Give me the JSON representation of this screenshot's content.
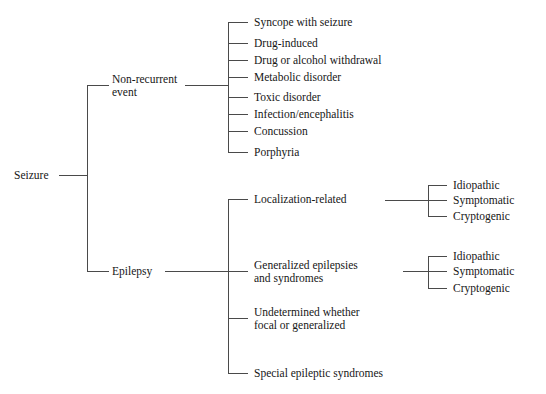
{
  "diagram": {
    "root": {
      "label": "Seizure"
    },
    "branches": [
      {
        "label_line1": "Non-recurrent",
        "label_line2": "event",
        "children": [
          {
            "label": "Syncope with seizure"
          },
          {
            "label": "Drug-induced"
          },
          {
            "label": "Drug or alcohol withdrawal"
          },
          {
            "label": "Metabolic disorder"
          },
          {
            "label": "Toxic disorder"
          },
          {
            "label": "Infection/encephalitis"
          },
          {
            "label": "Concussion"
          },
          {
            "label": "Porphyria"
          }
        ]
      },
      {
        "label_line1": "Epilepsy",
        "label_line2": "",
        "children": [
          {
            "label": "Localization-related",
            "subtypes": [
              {
                "label": "Idiopathic"
              },
              {
                "label": "Symptomatic"
              },
              {
                "label": "Cryptogenic"
              }
            ]
          },
          {
            "label_line1": "Generalized epilepsies",
            "label_line2": "and syndromes",
            "subtypes": [
              {
                "label": "Idiopathic"
              },
              {
                "label": "Symptomatic"
              },
              {
                "label": "Cryptogenic"
              }
            ]
          },
          {
            "label_line1": "Undetermined whether",
            "label_line2": "focal or generalized",
            "subtypes": []
          },
          {
            "label": "Special epileptic syndromes",
            "subtypes": []
          }
        ]
      }
    ],
    "colors": {
      "background": "#ffffff",
      "text": "#161616",
      "line": "#4a4a4a"
    }
  }
}
